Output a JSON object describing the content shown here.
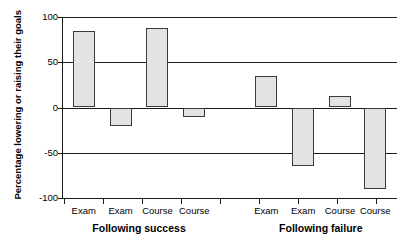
{
  "chart_data": {
    "type": "bar",
    "title": "",
    "xlabel": "",
    "ylabel": "Percentage lowering or raising their goals",
    "ylim": [
      -100,
      100
    ],
    "ytick_labels": [
      "100",
      "50",
      "0",
      "-50",
      "-100"
    ],
    "ytick_values": [
      100,
      50,
      0,
      -50,
      -100
    ],
    "grid": true,
    "gridlines_at": [
      100,
      50,
      0,
      -50
    ],
    "legend": "none",
    "categories": [
      "Exam",
      "Exam",
      "Course",
      "Course",
      "Exam",
      "Exam",
      "Course",
      "Course"
    ],
    "values": [
      85,
      -20,
      88,
      -11,
      35,
      -65,
      13,
      -90
    ],
    "groups": [
      {
        "label": "Following success",
        "categories": [
          "Exam",
          "Exam",
          "Course",
          "Course"
        ],
        "values": [
          85,
          -20,
          88,
          -11
        ]
      },
      {
        "label": "Following failure",
        "categories": [
          "Exam",
          "Exam",
          "Course",
          "Course"
        ],
        "values": [
          35,
          -65,
          13,
          -90
        ]
      }
    ],
    "bar_fill_color": "#e3e3e3",
    "bar_edge_color": "#3a3a3a",
    "axis_color": "#1a1a1a"
  }
}
